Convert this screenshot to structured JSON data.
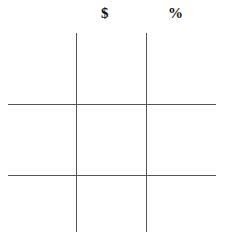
{
  "grid": {
    "column_headers": [
      "$",
      "%"
    ],
    "rows": 3,
    "columns": 3
  }
}
